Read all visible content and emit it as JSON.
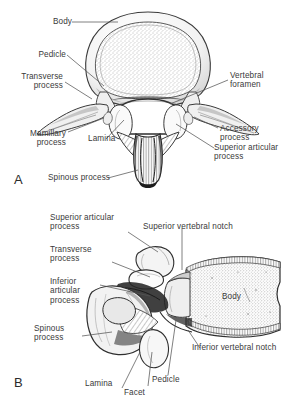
{
  "figure": {
    "background_color": "#ffffff",
    "ink_color": "#3a3a3a",
    "leader_color": "#555555"
  },
  "panels": [
    {
      "letter": "A",
      "view": "superior view",
      "labels": [
        {
          "id": "body",
          "text": "Body"
        },
        {
          "id": "pedicle",
          "text": "Pedicle"
        },
        {
          "id": "transverse-process",
          "text": "Transverse\nprocess"
        },
        {
          "id": "mamillary-process",
          "text": "Mamillary\nprocess"
        },
        {
          "id": "lamina",
          "text": "Lamina"
        },
        {
          "id": "spinous-process",
          "text": "Spinous process"
        },
        {
          "id": "vertebral-foramen",
          "text": "Vertebral\nforamen"
        },
        {
          "id": "accessory-process",
          "text": "Accessory\nprocess"
        },
        {
          "id": "superior-articular-process",
          "text": "Superior articular\nprocess"
        }
      ]
    },
    {
      "letter": "B",
      "view": "lateral view",
      "labels": [
        {
          "id": "superior-articular-process",
          "text": "Superior articular\nprocess"
        },
        {
          "id": "transverse-process",
          "text": "Transverse\nprocess"
        },
        {
          "id": "inferior-articular-process",
          "text": "Inferior\narticular\nprocess"
        },
        {
          "id": "spinous-process",
          "text": "Spinous\nprocess"
        },
        {
          "id": "superior-vertebral-notch",
          "text": "Superior vertebral notch"
        },
        {
          "id": "body",
          "text": "Body"
        },
        {
          "id": "inferior-vertebral-notch",
          "text": "Inferior vertebral notch"
        },
        {
          "id": "lamina",
          "text": "Lamina"
        },
        {
          "id": "pedicle",
          "text": "Pedicle"
        },
        {
          "id": "facet",
          "text": "Facet"
        }
      ]
    }
  ]
}
